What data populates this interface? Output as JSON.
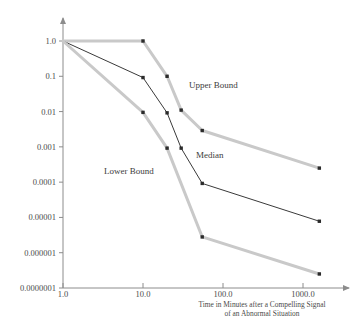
{
  "chart_data": {
    "type": "line",
    "title": "",
    "xlabel": "Time in Minutes after a Compelling Signal of an Abnormal Situation",
    "xlabel_line1": "Time in Minutes after a Compelling Signal",
    "xlabel_line2": "of an Abnormal Situation",
    "ylabel": "",
    "xscale": "log",
    "yscale": "log",
    "xlim": [
      1.0,
      3000.0
    ],
    "ylim": [
      1e-07,
      1.0
    ],
    "grid": false,
    "legend_position": "inline-annotations",
    "xticks": [
      "1.0",
      "10.0",
      "100.0",
      "1000.0"
    ],
    "xtick_values": [
      1.0,
      10.0,
      100.0,
      1000.0
    ],
    "yticks": [
      "1.0",
      "0.1",
      "0.01",
      "0.001",
      "0.0001",
      "0.00001",
      "0.000001",
      "0.0000001"
    ],
    "ytick_values": [
      1.0,
      0.1,
      0.01,
      0.001,
      0.0001,
      1e-05,
      1e-06,
      1e-07
    ],
    "series": [
      {
        "name": "Upper Bound",
        "color": "#c9c9c9",
        "style": "thick-gray",
        "x": [
          1.0,
          10.0,
          20.0,
          30.0,
          55.0,
          1600.0
        ],
        "y": [
          1.0,
          1.0,
          0.1,
          0.011,
          0.0029,
          0.00025
        ]
      },
      {
        "name": "Median",
        "color": "#3a3a3a",
        "style": "thin-dark",
        "x": [
          1.0,
          10.0,
          20.0,
          30.0,
          55.0,
          1600.0
        ],
        "y": [
          1.0,
          0.092,
          0.0092,
          0.00092,
          9.2e-05,
          7.8e-06
        ]
      },
      {
        "name": "Lower Bound",
        "color": "#c9c9c9",
        "style": "thick-gray",
        "x": [
          1.0,
          10.0,
          20.0,
          55.0,
          1600.0
        ],
        "y": [
          1.0,
          0.0095,
          0.00092,
          2.8e-06,
          2.5e-07
        ]
      }
    ],
    "annotations": [
      {
        "text": "Upper Bound",
        "x_px": 189,
        "y_px": 88
      },
      {
        "text": "Median",
        "x_px": 196,
        "y_px": 158
      },
      {
        "text": "Lower Bound",
        "x_px": 104,
        "y_px": 174
      }
    ],
    "axis_color": "#8c8c8c",
    "marker": "square"
  }
}
